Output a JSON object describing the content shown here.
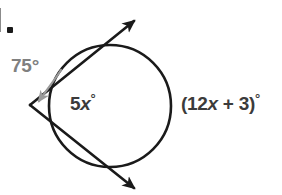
{
  "figure": {
    "type": "geometry-diagram",
    "topic": "circle with two tangent lines from an external point",
    "background_color": "#ffffff",
    "stroke_color": "#1a1a1a",
    "annotation_color": "#808080",
    "label_color": "#3b3b3b",
    "item_marker": {
      "name": "item-bullet",
      "text": "."
    },
    "circle": {
      "center_x": 110,
      "center_y": 106,
      "radius": 61,
      "stroke_width": 2.6
    },
    "vertex": {
      "x": 30,
      "y": 105,
      "label": "external point"
    },
    "tangent_upper": {
      "from_x": 30,
      "from_y": 105,
      "to_x": 136,
      "to_y": 20,
      "arrowhead": "arrow-up-right"
    },
    "tangent_lower": {
      "from_x": 30,
      "from_y": 105,
      "to_x": 136,
      "to_y": 189,
      "arrowhead": "arrow-down-right"
    },
    "annotation_arrow": {
      "name": "curved-arrow-to-vertex",
      "color": "#999999",
      "points_to": "vertex angle"
    }
  },
  "labels": {
    "exterior_angle": {
      "value": "75",
      "degree": "°",
      "full_text": "75°",
      "color": "#808080"
    },
    "near_arc": {
      "coefficient": "5",
      "variable": "x",
      "degree": "°",
      "full_text": "5x°",
      "color": "#3b3b3b"
    },
    "far_arc": {
      "open_paren": "(",
      "coefficient": "12",
      "variable": "x",
      "operator": " + ",
      "constant": "3",
      "close_paren": ")",
      "degree": "°",
      "full_text": "(12x + 3)°",
      "color": "#3b3b3b"
    }
  }
}
